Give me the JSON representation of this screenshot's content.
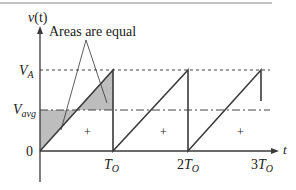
{
  "figure": {
    "y_axis_label": "v(t)",
    "y_axis_label_parts": {
      "main": "v",
      "paren": "(t)"
    },
    "x_axis_label": "t",
    "annotation": "Areas are equal",
    "levels": {
      "va": {
        "label_main": "V",
        "label_sub": "A"
      },
      "vavg": {
        "label_main": "V",
        "label_sub": "avg"
      },
      "zero": {
        "label": "0"
      }
    },
    "x_ticks": [
      {
        "coef": "",
        "main": "T",
        "sub": "O"
      },
      {
        "coef": "2",
        "main": "T",
        "sub": "O"
      },
      {
        "coef": "3",
        "main": "T",
        "sub": "O"
      }
    ],
    "region_signs": [
      "+",
      "+",
      "+"
    ],
    "colors": {
      "line": "#3a3a3a",
      "shade": "#bdbdbd",
      "background": "#ffffff"
    }
  }
}
